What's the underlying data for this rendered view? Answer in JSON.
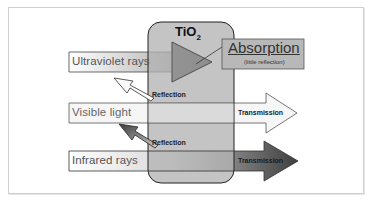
{
  "diagram": {
    "material": {
      "label": "TiO",
      "subscript": "2"
    },
    "rays": [
      {
        "name": "Ultraviolet rays",
        "outcome": "Absorption",
        "outcome_note": "(little reflection)"
      },
      {
        "name": "Visible light",
        "reflection": "Reflection",
        "outcome": "Transmission"
      },
      {
        "name": "Infrared rays",
        "reflection": "Reflection",
        "outcome": "Transmission"
      }
    ],
    "reflection_labels": [
      "Reflection",
      "Reflection"
    ]
  },
  "colors": {
    "tio2_fill": "#b9b9b9",
    "uv_arrow": "#8a8a8a",
    "visible_arrow": "#f2f2f2",
    "infrared_arrow": "#4a4a4a",
    "absorption_box": "#b5b5b5",
    "frame_border": "#cfcfcf"
  }
}
